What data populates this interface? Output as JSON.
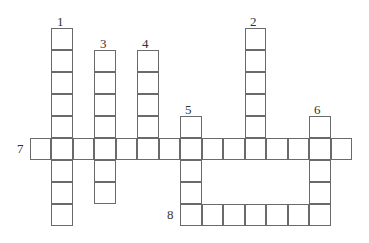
{
  "puzzle": {
    "type": "crossword",
    "cell_w": 21.5,
    "cell_h": 22,
    "origin_x": 30,
    "origin_y": 138,
    "entries": [
      {
        "number": "1",
        "direction": "down",
        "col": 1,
        "row": -5,
        "length": 9
      },
      {
        "number": "2",
        "direction": "down",
        "col": 10,
        "row": -5,
        "length": 6
      },
      {
        "number": "3",
        "direction": "down",
        "col": 3,
        "row": -4,
        "length": 7
      },
      {
        "number": "4",
        "direction": "down",
        "col": 5,
        "row": -4,
        "length": 5
      },
      {
        "number": "5",
        "direction": "down",
        "col": 7,
        "row": -1,
        "length": 5
      },
      {
        "number": "6",
        "direction": "down",
        "col": 13,
        "row": -1,
        "length": 5
      },
      {
        "number": "7",
        "direction": "across",
        "col": 0,
        "row": 0,
        "length": 15
      },
      {
        "number": "8",
        "direction": "across",
        "col": 7,
        "row": 3,
        "length": 7
      }
    ],
    "labels": [
      {
        "text": "1",
        "x": 57,
        "y": 15
      },
      {
        "text": "2",
        "x": 250,
        "y": 15
      },
      {
        "text": "3",
        "x": 100,
        "y": 37
      },
      {
        "text": "4",
        "x": 142,
        "y": 37
      },
      {
        "text": "5",
        "x": 185,
        "y": 103
      },
      {
        "text": "6",
        "x": 314,
        "y": 103
      },
      {
        "text": "7",
        "x": 17,
        "y": 142
      },
      {
        "text": "8",
        "x": 167,
        "y": 208
      }
    ]
  }
}
